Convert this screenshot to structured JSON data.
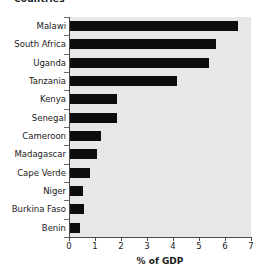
{
  "chart_data": {
    "type": "bar",
    "orientation": "horizontal",
    "title": "Countries",
    "xlabel": "% of GDP",
    "ylabel": "Countries",
    "xlim": [
      0,
      7
    ],
    "xticks": [
      0,
      1,
      2,
      3,
      4,
      5,
      6,
      7
    ],
    "xtick_labels": [
      "0",
      "1",
      "2",
      "3",
      "4",
      "5",
      "6",
      "7"
    ],
    "grid": false,
    "legend": null,
    "bar_color": "#0d0d0d",
    "plot_background": "#e7e7e7",
    "categories": [
      "Malawi",
      "South Africa",
      "Uganda",
      "Tanzania",
      "Kenya",
      "Senegal",
      "Cameroon",
      "Madagascar",
      "Cape Verde",
      "Niger",
      "Burkina Faso",
      "Benin"
    ],
    "values": [
      6.45,
      5.6,
      5.35,
      4.1,
      1.8,
      1.8,
      1.2,
      1.05,
      0.75,
      0.5,
      0.55,
      0.4
    ]
  }
}
